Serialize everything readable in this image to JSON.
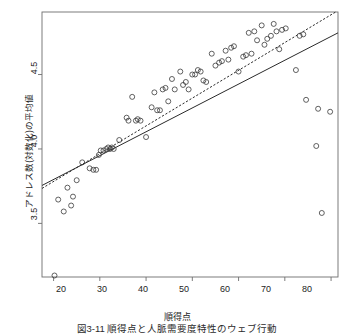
{
  "figure": {
    "kind": "scatter-plot",
    "background": "#ffffff",
    "frame_color": "#6e6e6e",
    "point_color": "#3a3a3a",
    "line_color": "#2a2a2a"
  },
  "axes": {
    "x_label": "順得点",
    "y_label": "アドレス数(対数化)の平均値",
    "x_ticks": [
      "20",
      "30",
      "40",
      "50",
      "60",
      "70",
      "80"
    ],
    "y_ticks": [
      "3.5",
      "4.0",
      "4.5"
    ]
  },
  "caption": {
    "text": "図3-11 順得点と人脈需要度特性のウェブ行動",
    "note": "cropped at image bottom edge"
  },
  "chart_data": {
    "type": "scatter",
    "title": "",
    "xlabel": "順得点",
    "ylabel": "アドレス数(対数化)の平均値",
    "xlim": [
      17.5,
      81.5
    ],
    "ylim": [
      3.14,
      4.92
    ],
    "grid": false,
    "legend": "none",
    "marker": "open-circle",
    "x": [
      20.2,
      21.0,
      22.2,
      23.0,
      23.8,
      24.2,
      25.0,
      26.2,
      27.8,
      28.6,
      29.2,
      29.8,
      30.2,
      30.8,
      31.4,
      31.8,
      32.2,
      32.6,
      33.0,
      34.2,
      35.8,
      36.2,
      37.0,
      37.8,
      38.2,
      38.8,
      40.0,
      41.2,
      41.8,
      42.4,
      43.0,
      43.6,
      44.2,
      44.8,
      45.6,
      46.2,
      47.4,
      48.0,
      48.6,
      49.2,
      50.0,
      50.6,
      51.2,
      51.8,
      52.4,
      53.0,
      54.2,
      55.0,
      55.8,
      56.4,
      57.2,
      57.8,
      58.4,
      59.0,
      60.0,
      61.0,
      61.6,
      62.2,
      62.8,
      63.4,
      64.0,
      65.0,
      65.6,
      66.2,
      67.0,
      67.6,
      68.2,
      68.8,
      69.4,
      70.2,
      72.4,
      73.2,
      74.0,
      74.6,
      76.8,
      77.2,
      78.0,
      79.8
    ],
    "y": [
      3.15,
      3.66,
      3.58,
      3.74,
      3.62,
      3.68,
      3.79,
      3.91,
      3.87,
      3.86,
      3.86,
      3.96,
      3.99,
      3.99,
      4.0,
      4.01,
      4.0,
      4.01,
      4.0,
      4.06,
      4.21,
      4.19,
      4.35,
      4.19,
      4.2,
      4.19,
      4.08,
      4.28,
      4.38,
      4.26,
      4.26,
      4.4,
      4.41,
      4.32,
      4.47,
      4.4,
      4.52,
      4.43,
      4.45,
      4.4,
      4.5,
      4.5,
      4.53,
      4.52,
      4.46,
      4.45,
      4.64,
      4.56,
      4.58,
      4.59,
      4.66,
      4.6,
      4.68,
      4.69,
      4.52,
      4.62,
      4.63,
      4.78,
      4.64,
      4.79,
      4.73,
      4.83,
      4.7,
      4.74,
      4.76,
      4.84,
      4.79,
      4.67,
      4.8,
      4.81,
      4.53,
      4.76,
      4.77,
      4.33,
      4.02,
      4.27,
      3.57,
      4.25
    ],
    "lines": [
      {
        "name": "linear-regression",
        "style": "solid",
        "x0": 17.5,
        "y0": 3.755,
        "x1": 81.5,
        "y1": 4.78
      },
      {
        "name": "loess-trend",
        "style": "dotted",
        "x0": 17.5,
        "y0": 3.735,
        "x1": 81.0,
        "y1": 4.92
      }
    ]
  }
}
